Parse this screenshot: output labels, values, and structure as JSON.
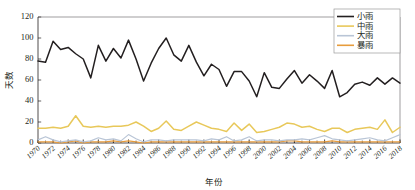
{
  "chart_data": {
    "type": "line",
    "title": "",
    "xlabel": "年份",
    "ylabel": "天数",
    "xlim": [
      1970,
      2018
    ],
    "ylim": [
      0,
      120
    ],
    "ytick_values": [
      0,
      20,
      40,
      60,
      80,
      100,
      120
    ],
    "ytick_labels": [
      "0",
      "20",
      "40",
      "60",
      "80",
      "100",
      "120"
    ],
    "xtick_values": [
      1970,
      1972,
      1974,
      1976,
      1978,
      1980,
      1982,
      1984,
      1986,
      1988,
      1990,
      1992,
      1994,
      1996,
      1998,
      2000,
      2002,
      2004,
      2006,
      2008,
      2010,
      2012,
      2014,
      2016,
      2018
    ],
    "xtick_labels": [
      "1970",
      "1972",
      "1974",
      "1976",
      "1978",
      "1980",
      "1982",
      "1984",
      "1986",
      "1988",
      "1990",
      "1992",
      "1994",
      "1996",
      "1998",
      "2000",
      "2002",
      "2004",
      "2006",
      "2008",
      "2010",
      "2012",
      "2014",
      "2016",
      "2018"
    ],
    "grid": false,
    "legend_position": "top-right",
    "x": [
      1970,
      1971,
      1972,
      1973,
      1974,
      1975,
      1976,
      1977,
      1978,
      1979,
      1980,
      1981,
      1982,
      1983,
      1984,
      1985,
      1986,
      1987,
      1988,
      1989,
      1990,
      1991,
      1992,
      1993,
      1994,
      1995,
      1996,
      1997,
      1998,
      1999,
      2000,
      2001,
      2002,
      2003,
      2004,
      2005,
      2006,
      2007,
      2008,
      2009,
      2010,
      2011,
      2012,
      2013,
      2014,
      2015,
      2016,
      2017,
      2018
    ],
    "series": [
      {
        "name": "小雨",
        "color": "#231f20",
        "width": 1.5,
        "values": [
          78,
          77,
          97,
          89,
          91,
          85,
          80,
          62,
          93,
          78,
          90,
          81,
          98,
          80,
          59,
          76,
          90,
          100,
          84,
          78,
          93,
          77,
          64,
          75,
          70,
          54,
          68,
          68,
          59,
          44,
          67,
          53,
          52,
          61,
          69,
          57,
          65,
          59,
          52,
          69,
          44,
          48,
          56,
          58,
          55,
          62,
          56,
          62,
          57
        ]
      },
      {
        "name": "中雨",
        "color": "#e8c85a",
        "width": 1.5,
        "values": [
          14,
          14,
          15,
          14,
          16,
          26,
          16,
          15,
          16,
          15,
          16,
          16,
          17,
          20,
          16,
          11,
          14,
          21,
          13,
          12,
          16,
          20,
          17,
          14,
          13,
          11,
          19,
          12,
          18,
          10,
          11,
          13,
          15,
          19,
          18,
          15,
          16,
          13,
          11,
          14,
          14,
          10,
          13,
          14,
          15,
          13,
          22,
          10,
          15
        ]
      },
      {
        "name": "大雨",
        "color": "#b9c5d6",
        "width": 1.2,
        "values": [
          3,
          6,
          3,
          1,
          2,
          3,
          1,
          2,
          5,
          3,
          4,
          2,
          8,
          4,
          1,
          3,
          3,
          2,
          3,
          3,
          3,
          3,
          2,
          4,
          3,
          6,
          2,
          3,
          6,
          2,
          3,
          3,
          2,
          3,
          3,
          4,
          3,
          5,
          7,
          4,
          3,
          2,
          3,
          4,
          5,
          3,
          2,
          5,
          8
        ]
      },
      {
        "name": "暴雨",
        "color": "#e79c3c",
        "width": 1.2,
        "values": [
          1,
          1,
          1,
          0,
          1,
          2,
          0,
          1,
          1,
          1,
          2,
          1,
          2,
          1,
          0,
          1,
          1,
          1,
          1,
          1,
          1,
          1,
          1,
          1,
          1,
          1,
          1,
          1,
          1,
          1,
          1,
          1,
          1,
          2,
          2,
          1,
          1,
          1,
          1,
          2,
          1,
          1,
          1,
          1,
          1,
          1,
          1,
          1,
          1
        ]
      }
    ],
    "legend_entries": [
      "小雨",
      "中雨",
      "大雨",
      "暴雨"
    ]
  }
}
